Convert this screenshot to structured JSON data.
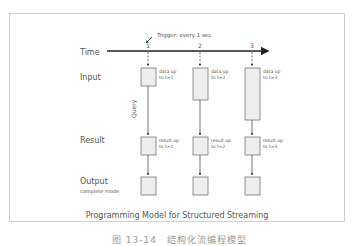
{
  "diagram": {
    "title": "Programming Model for Structured Streaming",
    "trigger_label": "Trigger: every 1 sec",
    "query_label": "Query",
    "rows": {
      "time": "Time",
      "input": "Input",
      "result": "Result",
      "output": "Output",
      "output_mode": "complete mode"
    },
    "columns": [
      {
        "tick": "1",
        "input_l1": "data up",
        "input_l2": "to t=1",
        "result_l1": "result up",
        "result_l2": "to t=1"
      },
      {
        "tick": "2",
        "input_l1": "data up",
        "input_l2": "to t=2",
        "result_l1": "result up",
        "result_l2": "to t=2"
      },
      {
        "tick": "3",
        "input_l1": "data up",
        "input_l2": "to t=3",
        "result_l1": "result up",
        "result_l2": "to t=3"
      }
    ],
    "colors": {
      "frame": "#cfcfcf",
      "line": "#222222",
      "box_fill": "#eeeeee",
      "box_stroke": "#777777",
      "text": "#555555"
    }
  },
  "caption": "图 13-14　结构化流编程模型"
}
